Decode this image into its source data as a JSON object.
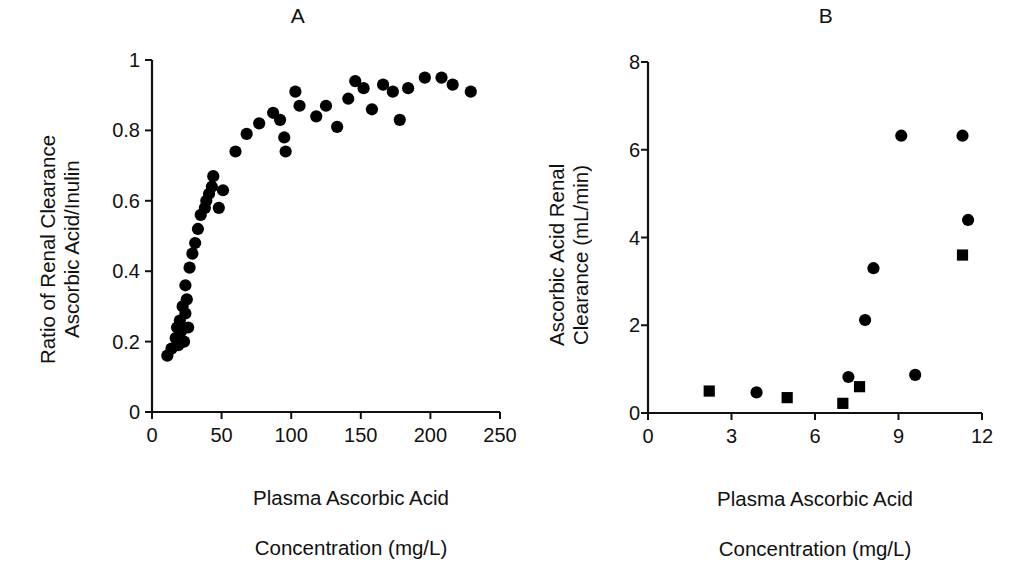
{
  "figure": {
    "background": "#ffffff",
    "ink": "#111111",
    "marker_color": "#000000"
  },
  "chart_data": [
    {
      "id": "panel-a",
      "type": "scatter",
      "title": "A",
      "xlabel": "Plasma Ascorbic Acid\nConcentration (mg/L)",
      "xlabel_line1": "Plasma Ascorbic Acid",
      "xlabel_line2": "Concentration (mg/L)",
      "ylabel": "Ratio of Renal Clearance\nAscorbic Acid/Inulin",
      "ylabel_line1": "Ratio of Renal Clearance",
      "ylabel_line2": "Ascorbic Acid/Inulin",
      "xlim": [
        0,
        250
      ],
      "ylim": [
        0,
        1
      ],
      "xticks": [
        0,
        50,
        100,
        150,
        200,
        250
      ],
      "xtick_labels": [
        "0",
        "50",
        "100",
        "150",
        "200",
        "250"
      ],
      "yticks": [
        0,
        0.2,
        0.4,
        0.6,
        0.8,
        1
      ],
      "ytick_labels": [
        "0",
        "0.2",
        "0.4",
        "0.6",
        "0.8",
        "1"
      ],
      "grid": false,
      "legend": "none",
      "series": [
        {
          "name": "Ascorbic acid / inulin clearance ratio",
          "marker": "circle",
          "color": "#000000",
          "points": [
            [
              11,
              0.16
            ],
            [
              14,
              0.18
            ],
            [
              17,
              0.21
            ],
            [
              18,
              0.24
            ],
            [
              19,
              0.19
            ],
            [
              20,
              0.26
            ],
            [
              21,
              0.23
            ],
            [
              22,
              0.3
            ],
            [
              23,
              0.2
            ],
            [
              24,
              0.28
            ],
            [
              24,
              0.36
            ],
            [
              25,
              0.32
            ],
            [
              26,
              0.24
            ],
            [
              27,
              0.41
            ],
            [
              29,
              0.45
            ],
            [
              31,
              0.48
            ],
            [
              33,
              0.52
            ],
            [
              35,
              0.56
            ],
            [
              38,
              0.58
            ],
            [
              39,
              0.6
            ],
            [
              41,
              0.62
            ],
            [
              43,
              0.64
            ],
            [
              44,
              0.67
            ],
            [
              48,
              0.58
            ],
            [
              51,
              0.63
            ],
            [
              60,
              0.74
            ],
            [
              68,
              0.79
            ],
            [
              77,
              0.82
            ],
            [
              87,
              0.85
            ],
            [
              92,
              0.83
            ],
            [
              95,
              0.78
            ],
            [
              96,
              0.74
            ],
            [
              103,
              0.91
            ],
            [
              106,
              0.87
            ],
            [
              118,
              0.84
            ],
            [
              125,
              0.87
            ],
            [
              133,
              0.81
            ],
            [
              141,
              0.89
            ],
            [
              146,
              0.94
            ],
            [
              152,
              0.92
            ],
            [
              158,
              0.86
            ],
            [
              166,
              0.93
            ],
            [
              173,
              0.91
            ],
            [
              178,
              0.83
            ],
            [
              184,
              0.92
            ],
            [
              196,
              0.95
            ],
            [
              208,
              0.95
            ],
            [
              216,
              0.93
            ],
            [
              229,
              0.91
            ]
          ]
        }
      ]
    },
    {
      "id": "panel-b",
      "type": "scatter",
      "title": "B",
      "xlabel": "Plasma Ascorbic Acid\nConcentration (mg/L)",
      "xlabel_line1": "Plasma Ascorbic Acid",
      "xlabel_line2": "Concentration (mg/L)",
      "ylabel": "Ascorbic Acid Renal\nClearance (mL/min)",
      "ylabel_line1": "Ascorbic Acid Renal",
      "ylabel_line2": "Clearance (mL/min)",
      "xlim": [
        0,
        12
      ],
      "ylim": [
        0,
        8
      ],
      "xticks": [
        0,
        3,
        6,
        9,
        12
      ],
      "xtick_labels": [
        "0",
        "3",
        "6",
        "9",
        "12"
      ],
      "yticks": [
        0,
        2,
        4,
        6,
        8
      ],
      "ytick_labels": [
        "0",
        "2",
        "4",
        "6",
        "8"
      ],
      "grid": false,
      "legend": "none",
      "series": [
        {
          "name": "Circle group",
          "marker": "circle",
          "color": "#000000",
          "points": [
            [
              3.9,
              0.47
            ],
            [
              7.2,
              0.82
            ],
            [
              7.8,
              2.12
            ],
            [
              8.1,
              3.3
            ],
            [
              9.1,
              6.32
            ],
            [
              9.6,
              0.87
            ],
            [
              11.3,
              6.32
            ],
            [
              11.5,
              4.4
            ]
          ]
        },
        {
          "name": "Square group",
          "marker": "square",
          "color": "#000000",
          "points": [
            [
              2.2,
              0.5
            ],
            [
              5.0,
              0.35
            ],
            [
              7.0,
              0.22
            ],
            [
              7.6,
              0.6
            ],
            [
              11.3,
              3.6
            ]
          ]
        }
      ]
    }
  ]
}
